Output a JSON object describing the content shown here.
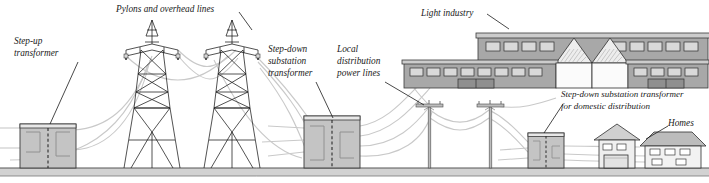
{
  "diagram": {
    "background_color": "#ffffff",
    "ground": {
      "label": "ground-line",
      "color": "#cfcfcf",
      "edge_color": "#555555",
      "y": 168,
      "height": 8
    },
    "palette": {
      "building_fill": "#c4c4c4",
      "building_dark": "#9a9a9a",
      "building_light": "#e4e4e4",
      "outline": "#3a3a3a",
      "wire": "#c9c9c9",
      "pylon": "#1a1a1a",
      "leader": "#1a1a1a",
      "text": "#1a1a1a"
    },
    "labels": [
      {
        "id": "step-up-transformer",
        "lines": [
          "Step-up",
          "transformer"
        ],
        "x": 14,
        "y": 42,
        "leader": {
          "x1": 78,
          "y1": 62,
          "x2": 50,
          "y2": 124
        }
      },
      {
        "id": "pylons-and-overhead-lines",
        "lines": [
          "Pylons and overhead lines"
        ],
        "x": 116,
        "y": 8,
        "leader": {
          "x1": 239,
          "y1": 12,
          "x2": 252,
          "y2": 30
        }
      },
      {
        "id": "step-down-substation-transformer",
        "lines": [
          "Step-down",
          "substation",
          "transformer"
        ],
        "x": 268,
        "y": 48,
        "leader": {
          "x1": 316,
          "y1": 82,
          "x2": 333,
          "y2": 118
        }
      },
      {
        "id": "local-distribution-power-lines",
        "lines": [
          "Local",
          "distribution",
          "power lines"
        ],
        "x": 325,
        "y": 48,
        "leader": {
          "x1": 385,
          "y1": 82,
          "x2": 424,
          "y2": 105
        }
      },
      {
        "id": "light-industry",
        "lines": [
          "Light industry"
        ],
        "x": 421,
        "y": 12,
        "leader": {
          "x1": 487,
          "y1": 14,
          "x2": 509,
          "y2": 29
        }
      },
      {
        "id": "step-down-substation-domestic",
        "lines": [
          "Step-down substation transformer",
          "for domestic distribution"
        ],
        "x": 561,
        "y": 93,
        "leader": {
          "x1": 563,
          "y1": 104,
          "x2": 544,
          "y2": 133
        }
      },
      {
        "id": "homes",
        "lines": [
          "Homes"
        ],
        "x": 668,
        "y": 122,
        "leader": {
          "x1": 668,
          "y1": 126,
          "x2": 646,
          "y2": 139
        }
      }
    ],
    "structures": [
      {
        "id": "step-up-transformer-building",
        "name": "Step-up transformer",
        "x": 20,
        "y": 124,
        "width": 56,
        "height": 44
      },
      {
        "id": "pylon-one",
        "name": "Transmission pylon",
        "x": 152,
        "y": 20,
        "height": 148
      },
      {
        "id": "pylon-two",
        "name": "Transmission pylon",
        "x": 232,
        "y": 20,
        "height": 148
      },
      {
        "id": "step-down-substation-building",
        "name": "Step-down substation transformer",
        "x": 304,
        "y": 116,
        "width": 56,
        "height": 52
      },
      {
        "id": "factory",
        "name": "Light industry",
        "x": 404,
        "y": 29,
        "width": 300,
        "height": 59
      },
      {
        "id": "utility-pole-one",
        "name": "Distribution pole",
        "x": 428,
        "y": 103,
        "height": 65
      },
      {
        "id": "utility-pole-two",
        "name": "Distribution pole",
        "x": 489,
        "y": 103,
        "height": 65
      },
      {
        "id": "domestic-substation-building",
        "name": "Domestic step-down substation",
        "x": 528,
        "y": 133,
        "width": 36,
        "height": 35
      },
      {
        "id": "house-small",
        "name": "Home with garage",
        "x": 596,
        "y": 133,
        "width": 42,
        "height": 35
      },
      {
        "id": "house-large",
        "name": "Home",
        "x": 642,
        "y": 139,
        "width": 60,
        "height": 29
      }
    ],
    "flow": [
      "Step-up transformer",
      "Pylons and overhead lines",
      "Step-down substation transformer",
      "Local distribution power lines",
      "Light industry",
      "Step-down substation transformer for domestic distribution",
      "Homes"
    ]
  }
}
